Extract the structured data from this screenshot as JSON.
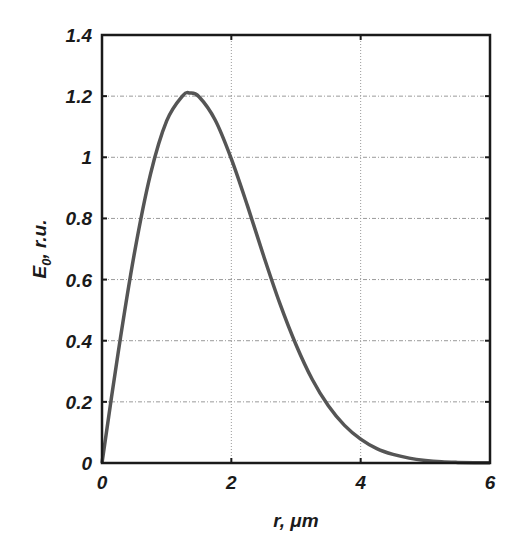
{
  "chart_data": {
    "type": "line",
    "title": "",
    "xlabel": "r, μm",
    "ylabel": "E0, r.u.",
    "ylabel_main": "E",
    "ylabel_sub": "0",
    "ylabel_rest": ", r.u.",
    "xlim": [
      0,
      6
    ],
    "ylim": [
      0,
      1.4
    ],
    "grid": true,
    "legend": null,
    "xticks": [
      0,
      2,
      4,
      6
    ],
    "xtick_labels": [
      "0",
      "2",
      "4",
      "6"
    ],
    "yticks": [
      0,
      0.2,
      0.4,
      0.6,
      0.8,
      1,
      1.2,
      1.4
    ],
    "ytick_labels": [
      "0",
      "0.2",
      "0.4",
      "0.6",
      "0.8",
      "1",
      "1.2",
      "1.4"
    ],
    "line_color": "#555555",
    "series": [
      {
        "name": "E0(r)",
        "x": [
          0,
          0.25,
          0.5,
          0.75,
          1.0,
          1.25,
          1.36,
          1.5,
          1.75,
          2.0,
          2.25,
          2.5,
          2.75,
          3.0,
          3.25,
          3.5,
          3.75,
          4.0,
          4.25,
          4.5,
          4.75,
          5.0,
          5.25,
          5.5,
          5.75,
          6.0
        ],
        "y": [
          0,
          0.361,
          0.685,
          0.945,
          1.119,
          1.202,
          1.21,
          1.198,
          1.122,
          0.995,
          0.841,
          0.677,
          0.522,
          0.387,
          0.274,
          0.187,
          0.123,
          0.078,
          0.047,
          0.028,
          0.016,
          0.0085,
          0.004,
          0.002,
          0.001,
          0.0005
        ]
      }
    ]
  }
}
